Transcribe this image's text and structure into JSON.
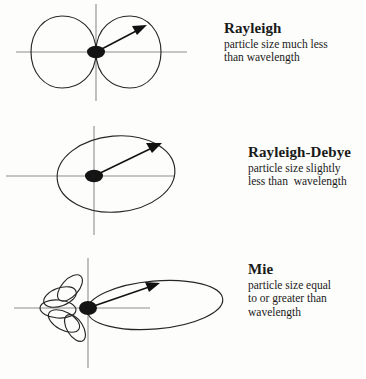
{
  "figure": {
    "background_color": "#fdfdfb",
    "ink_color": "#262626",
    "axis_color": "#8d8d8d"
  },
  "regimes": [
    {
      "id": "rayleigh",
      "title": "Rayleigh",
      "description_lines": [
        "particle size much less",
        "than wavelength"
      ],
      "pattern_type": "symmetric-dumbbell",
      "lobe_count": 2,
      "forward_to_back_ratio": 1.0
    },
    {
      "id": "rayleigh-debye",
      "title": "Rayleigh-Debye",
      "description_lines": [
        "particle size slightly",
        "less than  wavelength"
      ],
      "pattern_type": "forward-biased-ellipse",
      "lobe_count": 1,
      "forward_to_back_ratio": 3.5
    },
    {
      "id": "mie",
      "title": "Mie",
      "description_lines": [
        "particle size equal",
        "to or greater than",
        "wavelength"
      ],
      "pattern_type": "forward-lobe-with-side-petals",
      "lobe_count": 6,
      "forward_to_back_ratio": 6.0
    }
  ]
}
